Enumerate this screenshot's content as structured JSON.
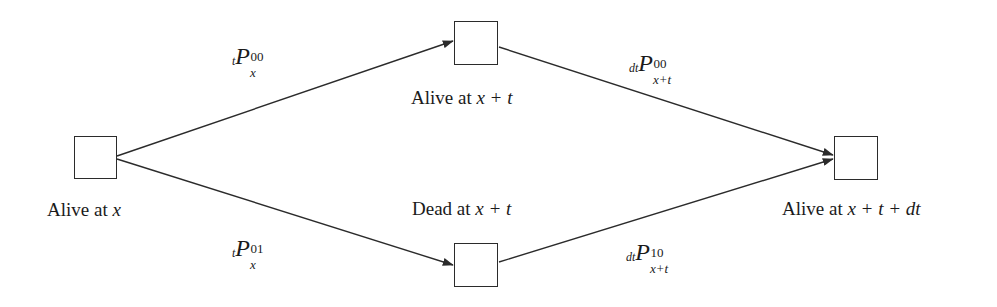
{
  "figure": {
    "background_color": "#ffffff",
    "line_color": "#2b2b2b"
  },
  "nodes": [
    {
      "id": "alive-at-x",
      "caption_prefix": "Alive at ",
      "caption_var": "x",
      "caption_full": "Alive at x"
    },
    {
      "id": "alive-at-x-plus-t",
      "caption_prefix": "Alive at ",
      "caption_var": "x + t",
      "caption_full": "Alive at x + t"
    },
    {
      "id": "dead-at-x-plus-t",
      "caption_prefix": "Dead at ",
      "caption_var": "x + t",
      "caption_full": "Dead at x + t"
    },
    {
      "id": "alive-at-x-plus-t-plus-dt",
      "caption_prefix": "Alive at ",
      "caption_var": "x + t + dt",
      "caption_full": "Alive at x + t + dt"
    }
  ],
  "edges": [
    {
      "id": "alive-x-to-alive-xt",
      "from": "alive-at-x",
      "to": "alive-at-x-plus-t",
      "label": {
        "presub": "t",
        "base": "P",
        "sup": "00",
        "sub": "x",
        "plain": "tP_x^00"
      }
    },
    {
      "id": "alive-xt-to-alive-xtdt",
      "from": "alive-at-x-plus-t",
      "to": "alive-at-x-plus-t-plus-dt",
      "label": {
        "presub": "dt",
        "base": "P",
        "sup": "00",
        "sub": "x+t",
        "plain": "dtP_{x+t}^00"
      }
    },
    {
      "id": "alive-x-to-dead-xt",
      "from": "alive-at-x",
      "to": "dead-at-x-plus-t",
      "label": {
        "presub": "t",
        "base": "P",
        "sup": "01",
        "sub": "x",
        "plain": "tP_x^01"
      }
    },
    {
      "id": "dead-xt-to-alive-xtdt",
      "from": "dead-at-x-plus-t",
      "to": "alive-at-x-plus-t-plus-dt",
      "label": {
        "presub": "dt",
        "base": "P",
        "sup": "10",
        "sub": "x+t",
        "plain": "dtP_{x+t}^10"
      }
    }
  ]
}
